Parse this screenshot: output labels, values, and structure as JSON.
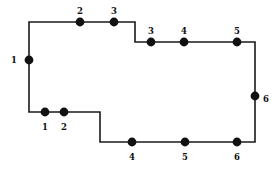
{
  "figure": {
    "background_color": "#ffffff",
    "stroke_color": "#1a1a1a",
    "node_fill_color": "#111111",
    "label_color": "#111111",
    "stroke_width": 1.6,
    "node_radius": 4.4,
    "canvas": {
      "width": 280,
      "height": 176
    }
  },
  "chart_data": {
    "type": "diagram",
    "polygon_vertices": [
      {
        "x": 29,
        "y": 22,
        "name": "top-left-corner"
      },
      {
        "x": 135,
        "y": 22,
        "name": "top-step-outer-corner"
      },
      {
        "x": 135,
        "y": 42,
        "name": "top-step-inner-corner"
      },
      {
        "x": 255,
        "y": 42,
        "name": "top-right-corner"
      },
      {
        "x": 255,
        "y": 142,
        "name": "bottom-right-corner"
      },
      {
        "x": 100,
        "y": 142,
        "name": "bottom-step-outer-corner"
      },
      {
        "x": 100,
        "y": 112,
        "name": "bottom-step-inner-corner"
      },
      {
        "x": 29,
        "y": 112,
        "name": "bottom-left-corner"
      }
    ],
    "nodes": [
      {
        "id": "left-1",
        "label": "1",
        "x": 29,
        "y": 60,
        "edge": "left",
        "label_x": 14,
        "label_y": 60
      },
      {
        "id": "top-2",
        "label": "2",
        "x": 80,
        "y": 22,
        "edge": "top",
        "label_x": 80,
        "label_y": 11
      },
      {
        "id": "top-3",
        "label": "3",
        "x": 114,
        "y": 22,
        "edge": "top",
        "label_x": 114,
        "label_y": 11
      },
      {
        "id": "upper-3",
        "label": "3",
        "x": 151,
        "y": 42,
        "edge": "upper-right",
        "label_x": 151,
        "label_y": 31
      },
      {
        "id": "upper-4",
        "label": "4",
        "x": 184,
        "y": 42,
        "edge": "upper-right",
        "label_x": 184,
        "label_y": 31
      },
      {
        "id": "upper-5",
        "label": "5",
        "x": 237,
        "y": 42,
        "edge": "upper-right",
        "label_x": 237,
        "label_y": 31
      },
      {
        "id": "right-6",
        "label": "6",
        "x": 255,
        "y": 96,
        "edge": "right",
        "label_x": 266,
        "label_y": 99
      },
      {
        "id": "bottom-4",
        "label": "4",
        "x": 132,
        "y": 142,
        "edge": "bottom",
        "label_x": 132,
        "label_y": 157
      },
      {
        "id": "bottom-5",
        "label": "5",
        "x": 185,
        "y": 142,
        "edge": "bottom",
        "label_x": 185,
        "label_y": 157
      },
      {
        "id": "bottom-6",
        "label": "6",
        "x": 237,
        "y": 142,
        "edge": "bottom",
        "label_x": 237,
        "label_y": 157
      },
      {
        "id": "lower-left-1",
        "label": "1",
        "x": 45,
        "y": 112,
        "edge": "lower-left",
        "label_x": 45,
        "label_y": 127
      },
      {
        "id": "lower-left-2",
        "label": "2",
        "x": 64,
        "y": 112,
        "edge": "lower-left",
        "label_x": 64,
        "label_y": 127
      }
    ],
    "node_count": 12,
    "vertex_count": 8,
    "xlabel": "",
    "ylabel": "",
    "grid": false,
    "legend": "none"
  }
}
